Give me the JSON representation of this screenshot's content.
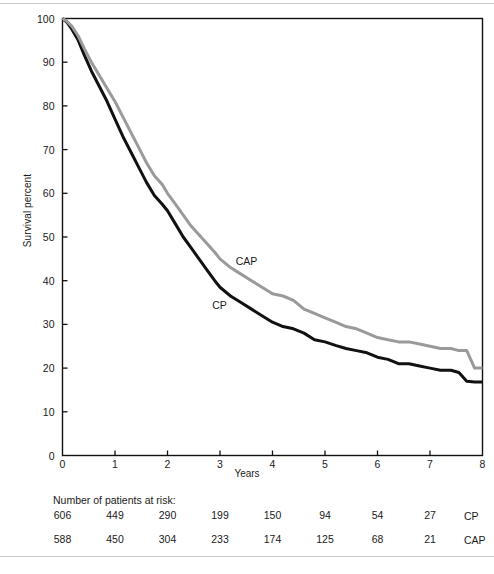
{
  "figure": {
    "top_rule": true,
    "bottom_rule": true
  },
  "chart_data": {
    "type": "line",
    "title": "",
    "xlabel": "Years",
    "ylabel": "Survival percent",
    "xlim": [
      0,
      8
    ],
    "ylim": [
      0,
      100
    ],
    "xticks": [
      0,
      1,
      2,
      3,
      4,
      5,
      6,
      7,
      8
    ],
    "xtick_labels": [
      "0",
      "1",
      "2",
      "3",
      "4",
      "5",
      "6",
      "7",
      "8"
    ],
    "yticks": [
      0,
      10,
      20,
      30,
      40,
      50,
      60,
      70,
      80,
      90,
      100
    ],
    "ytick_labels": [
      "0",
      "10",
      "20",
      "30",
      "40",
      "50",
      "60",
      "70",
      "80",
      "90",
      "100"
    ],
    "grid": false,
    "legend_position": "inline-annotations",
    "annotations": [
      {
        "text": "CAP",
        "x": 3.3,
        "y": 44.5
      },
      {
        "text": "CP",
        "x": 2.85,
        "y": 34.5
      }
    ],
    "series": [
      {
        "name": "CP",
        "color": "#111111",
        "label": "CP",
        "x": [
          0,
          0.08,
          0.18,
          0.3,
          0.42,
          0.55,
          0.7,
          0.85,
          1.0,
          1.15,
          1.3,
          1.45,
          1.6,
          1.75,
          1.9,
          2.0,
          2.15,
          2.3,
          2.45,
          2.6,
          2.75,
          2.9,
          3.0,
          3.2,
          3.4,
          3.6,
          3.8,
          4.0,
          4.2,
          4.4,
          4.6,
          4.8,
          5.0,
          5.2,
          5.4,
          5.6,
          5.8,
          6.0,
          6.2,
          6.4,
          6.6,
          6.8,
          7.0,
          7.2,
          7.4,
          7.55,
          7.7,
          7.85,
          8.0
        ],
        "y": [
          100,
          99.2,
          97.5,
          95.0,
          91.5,
          88.0,
          84.5,
          81.0,
          77.0,
          73.0,
          69.5,
          66.0,
          62.5,
          59.5,
          57.5,
          56.0,
          53.0,
          50.0,
          47.5,
          45.0,
          42.5,
          40.0,
          38.5,
          36.5,
          35.0,
          33.5,
          32.0,
          30.5,
          29.5,
          29.0,
          28.0,
          26.5,
          26.0,
          25.2,
          24.5,
          24.0,
          23.5,
          22.5,
          22.0,
          21.0,
          21.0,
          20.5,
          20.0,
          19.5,
          19.5,
          19.0,
          17.0,
          16.8,
          16.8
        ]
      },
      {
        "name": "CAP",
        "color": "#9a9a9a",
        "label": "CAP",
        "x": [
          0,
          0.08,
          0.18,
          0.3,
          0.42,
          0.55,
          0.7,
          0.85,
          1.0,
          1.15,
          1.3,
          1.45,
          1.6,
          1.75,
          1.9,
          2.0,
          2.15,
          2.3,
          2.45,
          2.6,
          2.75,
          2.9,
          3.0,
          3.2,
          3.4,
          3.6,
          3.8,
          4.0,
          4.2,
          4.4,
          4.6,
          4.8,
          5.0,
          5.2,
          5.4,
          5.6,
          5.8,
          6.0,
          6.2,
          6.4,
          6.6,
          6.8,
          7.0,
          7.2,
          7.4,
          7.55,
          7.7,
          7.85,
          8.0
        ],
        "y": [
          100,
          99.4,
          98.2,
          96.0,
          93.0,
          90.0,
          87.0,
          84.0,
          81.0,
          77.5,
          74.0,
          70.5,
          67.0,
          64.0,
          62.0,
          60.0,
          57.5,
          55.0,
          52.5,
          50.5,
          48.5,
          46.5,
          45.0,
          43.0,
          41.5,
          40.0,
          38.5,
          37.0,
          36.5,
          35.5,
          33.5,
          32.5,
          31.5,
          30.5,
          29.5,
          29.0,
          28.0,
          27.0,
          26.5,
          26.0,
          26.0,
          25.5,
          25.0,
          24.5,
          24.5,
          24.0,
          24.0,
          20.0,
          20.0
        ]
      }
    ]
  },
  "risk_table": {
    "title": "Number of patients at risk:",
    "columns": [
      "0",
      "1",
      "2",
      "3",
      "4",
      "5",
      "6",
      "7"
    ],
    "rows": [
      {
        "label": "CP",
        "values": [
          "606",
          "449",
          "290",
          "199",
          "150",
          "94",
          "54",
          "27"
        ]
      },
      {
        "label": "CAP",
        "values": [
          "588",
          "450",
          "304",
          "233",
          "174",
          "125",
          "68",
          "21"
        ]
      }
    ]
  }
}
